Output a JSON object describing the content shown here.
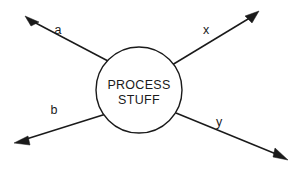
{
  "diagram": {
    "type": "process-black-box",
    "background_color": "#ffffff",
    "stroke_color": "#1a1a1a",
    "process": {
      "shape": "circle",
      "center_x": 139,
      "center_y": 90,
      "radius": 43,
      "fill_color": "#ffffff",
      "line_1": "PROCESS",
      "line_2": "STUFF"
    },
    "flows": [
      {
        "id": "flow-a",
        "label": "a",
        "direction": "upper-left",
        "label_x": 58,
        "label_y": 34,
        "line_x1": 108,
        "line_y1": 61,
        "line_x2": 30,
        "line_y2": 20,
        "tip_x": 25,
        "tip_y": 16,
        "head_points": "25,16 39,22 31,26"
      },
      {
        "id": "flow-b",
        "label": "b",
        "direction": "lower-left",
        "label_x": 54,
        "label_y": 114,
        "line_x1": 106,
        "line_y1": 114,
        "line_x2": 20,
        "line_y2": 141,
        "tip_x": 14,
        "tip_y": 143,
        "head_points": "14,143 28,136 30,145"
      },
      {
        "id": "flow-x",
        "label": "x",
        "direction": "upper-right",
        "label_x": 206,
        "label_y": 34,
        "line_x1": 172,
        "line_y1": 65,
        "line_x2": 253,
        "line_y2": 16,
        "tip_x": 259,
        "tip_y": 11,
        "head_points": "259,11 245,16 252,23"
      },
      {
        "id": "flow-y",
        "label": "y",
        "direction": "lower-right",
        "label_x": 219,
        "label_y": 126,
        "line_x1": 176,
        "line_y1": 113,
        "line_x2": 281,
        "line_y2": 156,
        "tip_x": 288,
        "tip_y": 160,
        "head_points": "288,160 273,157 275,148"
      }
    ]
  }
}
